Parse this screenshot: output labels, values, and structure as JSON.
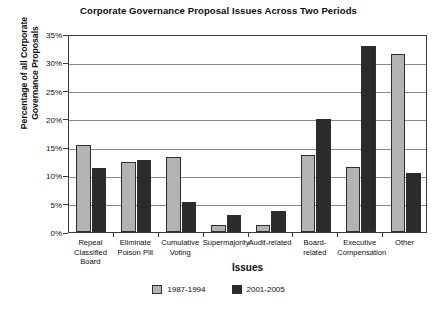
{
  "chart_data": {
    "type": "bar",
    "title": "Corporate Governance Proposal Issues Across Two Periods",
    "xlabel": "Issues",
    "ylabel": "Percentage of all Corporate Governance Proposals",
    "ylabel_line1": "Percentage of all Corporate",
    "ylabel_line2": "Governance Proposals",
    "categories": [
      "Repeal Classified Board",
      "Eliminate Poison Pill",
      "Cumulative Voting",
      "Supermajority",
      "Audit-related",
      "Board-related",
      "Executive Compensation",
      "Other"
    ],
    "category_lines": [
      [
        "Repeal",
        "Classified",
        "Board"
      ],
      [
        "Eliminate",
        "Poison Pill"
      ],
      [
        "Cumulative",
        "Voting"
      ],
      [
        "Supermajority"
      ],
      [
        "Audit-related"
      ],
      [
        "Board-related"
      ],
      [
        "Executive",
        "Compensation"
      ],
      [
        "Other"
      ]
    ],
    "series": [
      {
        "name": "1987-1994",
        "color": "#b3b3b3",
        "values": [
          15.4,
          12.3,
          13.2,
          1.2,
          1.2,
          13.7,
          11.5,
          31.5
        ]
      },
      {
        "name": "2001-2005",
        "color": "#2b2b2b",
        "values": [
          11.4,
          12.7,
          5.3,
          3.0,
          3.8,
          20.0,
          32.8,
          10.5
        ]
      }
    ],
    "ylim": [
      0,
      35
    ],
    "ytick_values": [
      0,
      5,
      10,
      15,
      20,
      25,
      30,
      35
    ],
    "ytick_labels": [
      "0%",
      "5%",
      "10%",
      "15%",
      "20%",
      "25%",
      "30%",
      "35%"
    ],
    "grid": true,
    "legend_position": "bottom-center"
  }
}
